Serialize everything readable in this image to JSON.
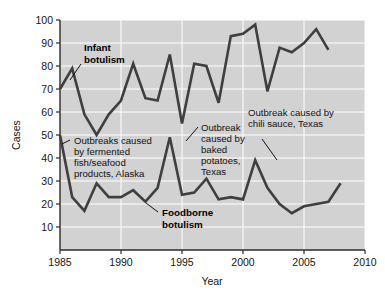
{
  "chart_data": {
    "type": "line",
    "title": "",
    "xlabel": "Year",
    "ylabel": "Cases",
    "xlim": [
      1985,
      2010
    ],
    "ylim": [
      0,
      100
    ],
    "xticks": [
      1985,
      1990,
      1995,
      2000,
      2005,
      2010
    ],
    "yticks": [
      10,
      20,
      30,
      40,
      50,
      60,
      70,
      80,
      90,
      100
    ],
    "grid": true,
    "legend_position": "none",
    "plot_background": "#d2d2d2",
    "gridline_color": "#ffffff",
    "line_color": "#3f3f3f",
    "x": [
      1985,
      1986,
      1987,
      1988,
      1989,
      1990,
      1991,
      1992,
      1993,
      1994,
      1995,
      1996,
      1997,
      1998,
      1999,
      2000,
      2001,
      2002,
      2003,
      2004,
      2005,
      2006,
      2007,
      2008
    ],
    "series": [
      {
        "name": "Infant botulism",
        "values": [
          70,
          79,
          59,
          50,
          59,
          65,
          81,
          66,
          65,
          85,
          55,
          81,
          80,
          64,
          93,
          94,
          98,
          69,
          88,
          86,
          90,
          96,
          87,
          null
        ]
      },
      {
        "name": "Foodborne botulism",
        "values": [
          50,
          23,
          17,
          29,
          23,
          23,
          26,
          21,
          27,
          49,
          24,
          25,
          31,
          22,
          23,
          22,
          39,
          27,
          20,
          16,
          19,
          20,
          21,
          29
        ]
      }
    ]
  },
  "annotations": [
    {
      "id": "infant-botulism",
      "lines": [
        "Infant",
        "botulism"
      ],
      "bold": true,
      "leader": {
        "x1": 81,
        "y1": 64,
        "x2": 70,
        "y2": 80
      }
    },
    {
      "id": "outbreaks-fermented-alaska",
      "lines": [
        "Outbreaks caused",
        "by fermented",
        "fish/seafood",
        "products, Alaska"
      ],
      "bold": false,
      "leader": {
        "x1": 70,
        "y1": 140,
        "x2": 62,
        "y2": 144
      }
    },
    {
      "id": "outbreak-baked-potatoes-texas",
      "lines": [
        "Outbreak",
        "caused by",
        "baked",
        "potatoes,",
        "Texas"
      ],
      "bold": false,
      "leader": {
        "x1": 198,
        "y1": 127,
        "x2": 186,
        "y2": 141
      }
    },
    {
      "id": "outbreak-chili-sauce-texas",
      "lines": [
        "Outbreak caused by",
        "chili sauce, Texas"
      ],
      "bold": false,
      "leader": {
        "x1": 262,
        "y1": 139,
        "x2": 277,
        "y2": 160
      }
    },
    {
      "id": "foodborne-botulism",
      "lines": [
        "Foodborne",
        "botulism"
      ],
      "bold": true,
      "leader": {
        "x1": 158,
        "y1": 212,
        "x2": 146,
        "y2": 203
      }
    }
  ]
}
